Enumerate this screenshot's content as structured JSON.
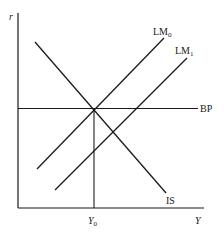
{
  "diagram": {
    "type": "IS-LM-BP",
    "axes": {
      "y_label": "r",
      "x_label": "Y"
    },
    "curves": {
      "IS": {
        "label": "IS"
      },
      "LM0": {
        "label": "LM",
        "subscript": "0"
      },
      "LM1": {
        "label": "LM",
        "subscript": "1"
      },
      "BP": {
        "label": "BP"
      }
    },
    "equilibrium": {
      "label": "Y",
      "subscript": "0"
    },
    "colors": {
      "line": "#1a1a1a",
      "background": "#ffffff"
    }
  }
}
